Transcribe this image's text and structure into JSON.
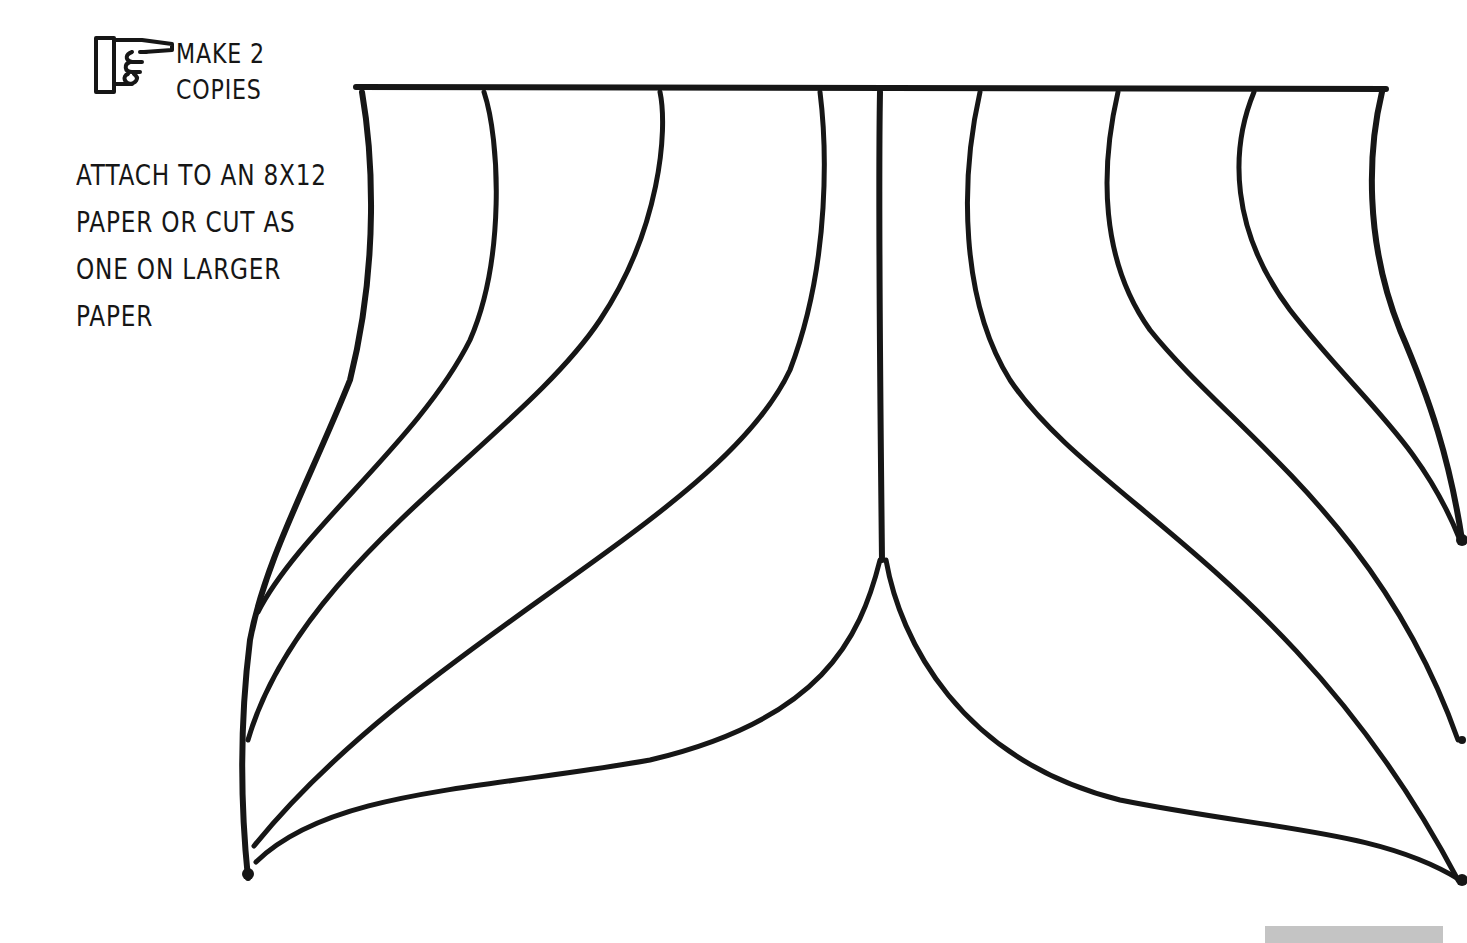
{
  "page": {
    "kind": "craft-template",
    "background_color": "#ffffff",
    "ink_color": "#161616"
  },
  "instructions": {
    "copies_icon": "pointing-hand-icon",
    "copies_lines": [
      "MAKE 2",
      "COPIES"
    ],
    "attach_lines": [
      "ATTACH TO AN 8X12",
      "PAPER OR CUT AS",
      "ONE ON LARGER",
      "PAPER"
    ]
  },
  "template": {
    "shape": "fan-tail-panels",
    "panel_count_left": 5,
    "panel_count_right": 5
  },
  "footer": {
    "bar_color": "#c4c4c4"
  }
}
